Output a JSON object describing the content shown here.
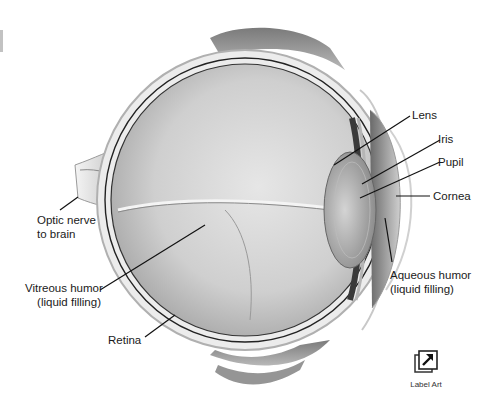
{
  "diagram": {
    "labels": [
      {
        "id": "lens",
        "text": "Lens"
      },
      {
        "id": "iris",
        "text": "Iris"
      },
      {
        "id": "pupil",
        "text": "Pupil"
      },
      {
        "id": "cornea",
        "text": "Cornea"
      },
      {
        "id": "optic_nerve",
        "line1": "Optic nerve",
        "line2": "to brain"
      },
      {
        "id": "vitreous",
        "line1": "Vitreous humor",
        "line2": "(liquid filling)"
      },
      {
        "id": "aqueous",
        "line1": "Aqueous humor",
        "line2": "(liquid filling)"
      },
      {
        "id": "retina",
        "text": "Retina"
      }
    ]
  },
  "controls": {
    "label_art": {
      "label": "Label Art",
      "icon": "arrow-up-right-icon"
    }
  },
  "colors": {
    "line": "#111111",
    "text": "#1a1a1a",
    "eye_fill_light": "#e8e8e8",
    "eye_fill_dark": "#9a9a9a"
  }
}
